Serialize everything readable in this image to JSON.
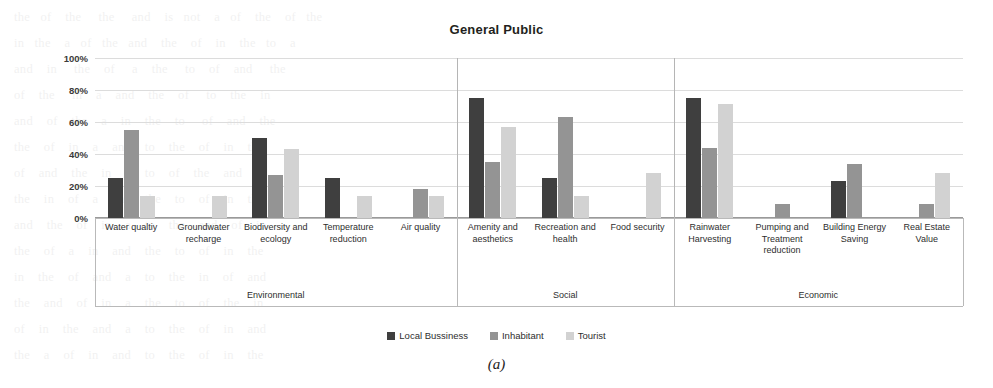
{
  "figure": {
    "caption": "(a)"
  },
  "chart_data": {
    "type": "bar",
    "title": "General Public",
    "xlabel": "",
    "ylabel": "",
    "ylim": [
      0,
      100
    ],
    "yticks": [
      "0%",
      "20%",
      "40%",
      "60%",
      "80%",
      "100%"
    ],
    "ytick_values": [
      0,
      20,
      40,
      60,
      80,
      100
    ],
    "grid": true,
    "legend_position": "bottom",
    "categories": [
      "Water qualtiy",
      "Groundwater recharge",
      "Biodiversity and ecology",
      "Temperature reduction",
      "Air quality",
      "Amenity and aesthetics",
      "Recreation and health",
      "Food security",
      "Rainwater Harvesting",
      "Pumping and Treatment reduction",
      "Building Energy Saving",
      "Real Estate Value"
    ],
    "series": [
      {
        "name": "Local Bussiness",
        "color": "#3f3f3f",
        "values": [
          25,
          0,
          50,
          25,
          0,
          75,
          25,
          0,
          75,
          0,
          23,
          0
        ]
      },
      {
        "name": "Inhabitant",
        "color": "#949494",
        "values": [
          55,
          0,
          27,
          0,
          18,
          35,
          63,
          0,
          44,
          9,
          34,
          9
        ]
      },
      {
        "name": "Tourist",
        "color": "#d2d2d2",
        "values": [
          14,
          14,
          43,
          14,
          14,
          57,
          14,
          28,
          71,
          0,
          0,
          28
        ]
      }
    ],
    "groups": [
      {
        "label": "Environmental",
        "span": 5
      },
      {
        "label": "Social",
        "span": 3
      },
      {
        "label": "Economic",
        "span": 4
      }
    ]
  },
  "background_text": "the   of    the     the     and    is   not    a   of    the    of   the\nin   the    a   of   the   and    the    of    in    the   to    a\nand    in     the    of     a    the     to    of    and     the\nof    the     in    a    and    the    of     to    the    in\nand    of    the    a    in    the    to     of    and    the\nthe    of    in    a    and    to    the    of    in    the\nof    and    the    in    a    to    of    the    and    in\nthe    in    of    a    and    the    to    of    in    the\nand    the    of    in    a    to    the    and    of    in\nthe    of    a    in    and    the    to    of    in    the\nin    the    of    and    a    to    the    in    of    and\nthe    and    of    in    a    the    to    of    the    in\nof    in    the    and    a    to    the    of    in    and\nthe    a    of    in    and    to    the    of    in    the"
}
